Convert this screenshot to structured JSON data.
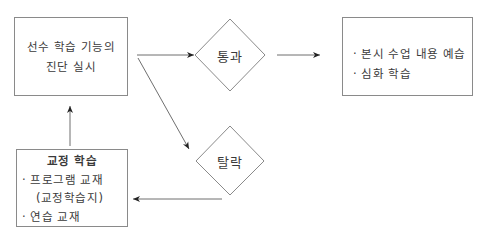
{
  "diagram": {
    "nodes": {
      "diagnosis": {
        "lines": [
          "선수 학습 기능의",
          "진단 실시"
        ]
      },
      "pass": {
        "label": "통과"
      },
      "fail": {
        "label": "탈락"
      },
      "advanced": {
        "items": [
          "· 본시 수업 내용 예습",
          "· 심화 학습"
        ]
      },
      "remedial": {
        "title": "교정 학습",
        "items": [
          "· 프로그램 교재",
          "(교정학습지)",
          "· 연습 교재"
        ]
      }
    },
    "edges": [
      {
        "from": "diagnosis",
        "to": "pass"
      },
      {
        "from": "diagnosis",
        "to": "fail"
      },
      {
        "from": "pass",
        "to": "advanced"
      },
      {
        "from": "fail",
        "to": "remedial"
      },
      {
        "from": "remedial",
        "to": "diagnosis"
      }
    ],
    "colors": {
      "line": "#6f6f6f",
      "border": "#8a8a8a",
      "text": "#3a3a3a"
    }
  }
}
